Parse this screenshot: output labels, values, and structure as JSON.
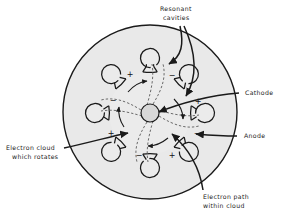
{
  "figure": {
    "background_color": "#ffffff",
    "line_color": "#1a1a1a",
    "envelope_fill": "#e9e9e9",
    "anode_fill": "#ebebeb",
    "cathode_fill": "#d8d8d8",
    "dash_color": "#6a6a6a"
  },
  "labels": {
    "resonant_cavities": {
      "line1": "Resonant",
      "line2": "cavities"
    },
    "cathode": {
      "line1": "Cathode"
    },
    "anode": {
      "line1": "Anode"
    },
    "electron_cloud": {
      "line1": "Electron cloud",
      "line2": "which  rotates"
    },
    "electron_path": {
      "line1": "Electron  path",
      "line2": "within cloud"
    }
  },
  "diagram_data": {
    "cavity_count": 8,
    "cathode_center": [
      150,
      113
    ],
    "cathode_radius": 9,
    "anode_radius": 41,
    "envelope_center": [
      150,
      112
    ],
    "envelope_radius": 87,
    "cavity_bore_radius": 9.5,
    "cavity_ring_radius": 55,
    "polarity_signs": [
      "+",
      "-",
      "+",
      "-",
      "+",
      "-",
      "+",
      "-"
    ],
    "polarity_labels": [
      {
        "sign": "+",
        "x": 130,
        "y": 74
      },
      {
        "sign": "-",
        "x": 172,
        "y": 75
      },
      {
        "sign": "+",
        "x": 198,
        "y": 101
      },
      {
        "sign": "-",
        "x": 197,
        "y": 133
      },
      {
        "sign": "+",
        "x": 172,
        "y": 155
      },
      {
        "sign": "-",
        "x": 139,
        "y": 155
      },
      {
        "sign": "+",
        "x": 111,
        "y": 133
      },
      {
        "sign": "-",
        "x": 113,
        "y": 100
      }
    ],
    "electron_spoke_count": 4,
    "rotation_direction": "counter-clockwise"
  }
}
